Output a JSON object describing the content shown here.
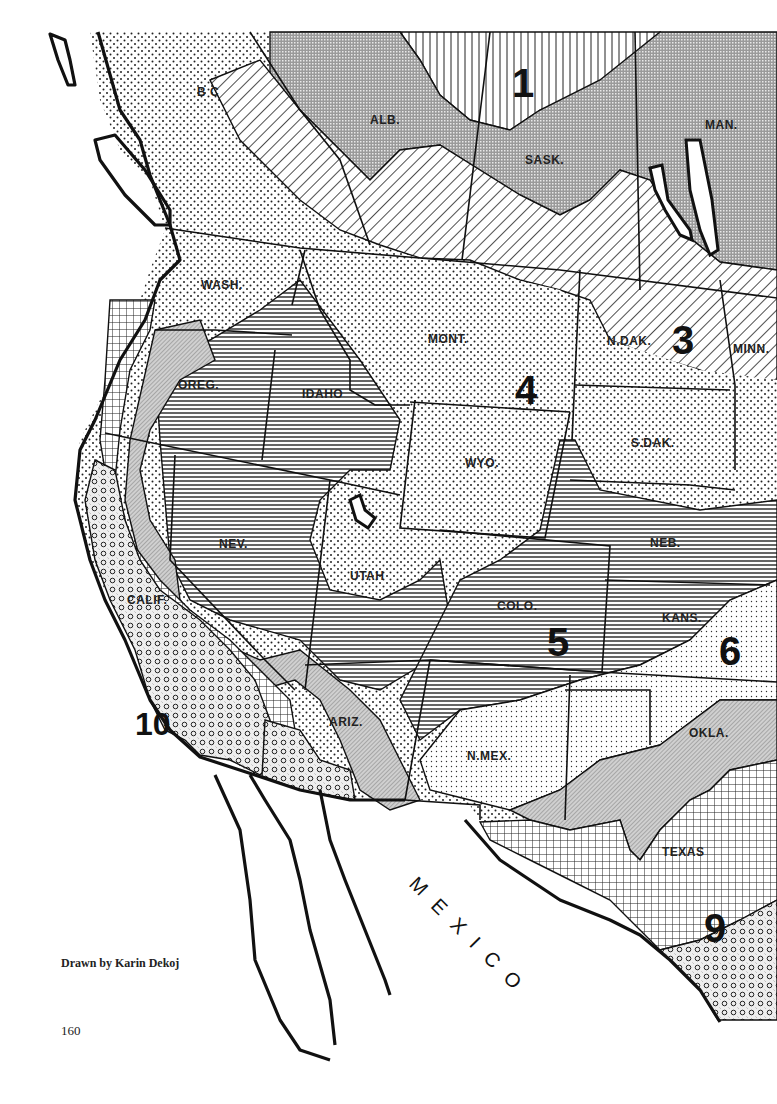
{
  "map": {
    "title": "Plant hardiness zones — western North America",
    "zones": [
      {
        "id": "1",
        "label": "1",
        "pattern": "vertical-lines"
      },
      {
        "id": "2",
        "pattern": "dense-crosshatch"
      },
      {
        "id": "3",
        "label": "3",
        "pattern": "diagonal-lines"
      },
      {
        "id": "4",
        "label": "4",
        "pattern": "dots"
      },
      {
        "id": "5",
        "label": "5",
        "pattern": "horizontal-lines"
      },
      {
        "id": "6",
        "label": "6",
        "pattern": "fine-dots"
      },
      {
        "id": "7",
        "pattern": "fine-diagonal-gray"
      },
      {
        "id": "8",
        "pattern": "grid"
      },
      {
        "id": "9",
        "label": "9",
        "pattern": "small-circles"
      },
      {
        "id": "10",
        "label": "10",
        "pattern": "circles-dense"
      }
    ],
    "zone_labels": {
      "z1": "1",
      "z3": "3",
      "z4": "4",
      "z5": "5",
      "z6": "6",
      "z9": "9",
      "z10": "10"
    },
    "state_labels": {
      "bc": "B C",
      "alb": "ALB.",
      "sask": "SASK.",
      "man": "MAN.",
      "wash": "WASH.",
      "mont": "MONT.",
      "ndak": "N.DAK.",
      "minn": "MINN.",
      "oreg": "OREG.",
      "idaho": "IDAHO",
      "wyo": "WYO.",
      "sdak": "S.DAK.",
      "nev": "NEV.",
      "utah": "UTAH",
      "neb": "NEB.",
      "calif": "CALIF.",
      "colo": "COLO.",
      "kans": "KANS.",
      "ariz": "ARIZ.",
      "nmex": "N.MEX.",
      "okla": "OKLA.",
      "texas": "TEXAS"
    },
    "country_label": "MEXICO",
    "colors": {
      "ink": "#111111",
      "paper": "#ffffff",
      "gray_fill": "#d8d8d8"
    }
  },
  "footer": {
    "credit": "Drawn by Karin Dekoj",
    "page_number": "160"
  }
}
